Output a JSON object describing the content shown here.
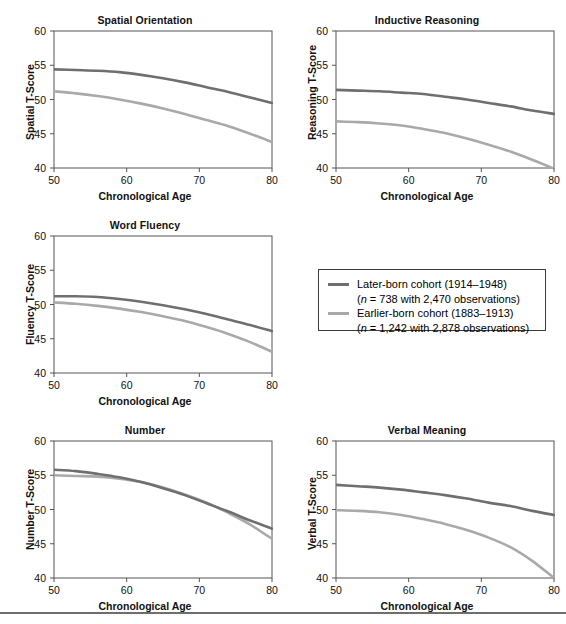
{
  "figure": {
    "x_axis_label": "Chronological Age",
    "x_ticks": [
      "50",
      "60",
      "70",
      "80"
    ],
    "y_ticks": [
      "40",
      "45",
      "50",
      "55",
      "60"
    ],
    "xlim": [
      50,
      80
    ],
    "ylim": [
      40,
      60
    ]
  },
  "legend": {
    "series": [
      {
        "key": "later",
        "color": "#6f6f6f",
        "line1": "Later-born cohort (1914–1948)",
        "line2_prefix": "n",
        "line2": " = 738 with 2,470 observations)",
        "line2_open": "("
      },
      {
        "key": "earlier",
        "color": "#a9a9a9",
        "line1": "Earlier-born cohort (1883–1913)",
        "line2_prefix": "n",
        "line2": " = 1,242 with 2,878 observations)",
        "line2_open": "("
      }
    ]
  },
  "chart_data": [
    {
      "id": "spatial-orientation",
      "type": "line",
      "title": "Spatial Orientation",
      "xlabel": "Chronological Age",
      "ylabel": "Spatial T-Score",
      "xlim": [
        50,
        80
      ],
      "ylim": [
        40,
        60
      ],
      "xticks": [
        50,
        60,
        70,
        80
      ],
      "yticks": [
        40,
        45,
        50,
        55,
        60
      ],
      "grid": false,
      "legend_position": "external-middle-right",
      "x": [
        50,
        53,
        56,
        59,
        62,
        65,
        68,
        71,
        74,
        77,
        80
      ],
      "series": [
        {
          "name": "Later-born cohort (1914–1948)",
          "color": "#6f6f6f",
          "values": [
            54.4,
            54.3,
            54.2,
            54.0,
            53.6,
            53.1,
            52.5,
            51.8,
            51.1,
            50.3,
            49.5
          ]
        },
        {
          "name": "Earlier-born cohort (1883–1913)",
          "color": "#a9a9a9",
          "values": [
            51.2,
            50.9,
            50.5,
            50.0,
            49.4,
            48.7,
            47.9,
            47.0,
            46.1,
            45.0,
            43.8
          ]
        }
      ]
    },
    {
      "id": "inductive-reasoning",
      "type": "line",
      "title": "Inductive Reasoning",
      "xlabel": "Chronological Age",
      "ylabel": "Reasoning T-Score",
      "xlim": [
        50,
        80
      ],
      "ylim": [
        40,
        60
      ],
      "xticks": [
        50,
        60,
        70,
        80
      ],
      "yticks": [
        40,
        45,
        50,
        55,
        60
      ],
      "grid": false,
      "x": [
        50,
        53,
        56,
        59,
        62,
        65,
        68,
        71,
        74,
        77,
        80
      ],
      "series": [
        {
          "name": "Later-born cohort (1914–1948)",
          "color": "#6f6f6f",
          "values": [
            51.4,
            51.3,
            51.2,
            51.0,
            50.8,
            50.4,
            50.0,
            49.5,
            49.0,
            48.4,
            47.9
          ]
        },
        {
          "name": "Earlier-born cohort (1883–1913)",
          "color": "#a9a9a9",
          "values": [
            46.8,
            46.7,
            46.5,
            46.2,
            45.7,
            45.1,
            44.3,
            43.4,
            42.4,
            41.2,
            39.9
          ]
        }
      ]
    },
    {
      "id": "word-fluency",
      "type": "line",
      "title": "Word Fluency",
      "xlabel": "Chronological Age",
      "ylabel": "Fluency T-Score",
      "xlim": [
        50,
        80
      ],
      "ylim": [
        40,
        60
      ],
      "xticks": [
        50,
        60,
        70,
        80
      ],
      "yticks": [
        40,
        45,
        50,
        55,
        60
      ],
      "grid": false,
      "x": [
        50,
        53,
        56,
        59,
        62,
        65,
        68,
        71,
        74,
        77,
        80
      ],
      "series": [
        {
          "name": "Later-born cohort (1914–1948)",
          "color": "#6f6f6f",
          "values": [
            51.2,
            51.2,
            51.1,
            50.8,
            50.4,
            49.9,
            49.3,
            48.6,
            47.8,
            47.0,
            46.1
          ]
        },
        {
          "name": "Earlier-born cohort (1883–1913)",
          "color": "#a9a9a9",
          "values": [
            50.3,
            50.1,
            49.8,
            49.4,
            48.9,
            48.3,
            47.6,
            46.7,
            45.7,
            44.5,
            43.1
          ]
        }
      ]
    },
    {
      "id": "number",
      "type": "line",
      "title": "Number",
      "xlabel": "Chronological Age",
      "ylabel": "Number T-Score",
      "xlim": [
        50,
        80
      ],
      "ylim": [
        40,
        60
      ],
      "xticks": [
        50,
        60,
        70,
        80
      ],
      "yticks": [
        40,
        45,
        50,
        55,
        60
      ],
      "grid": false,
      "x": [
        50,
        53,
        56,
        59,
        62,
        65,
        68,
        71,
        74,
        77,
        80
      ],
      "series": [
        {
          "name": "Later-born cohort (1914–1948)",
          "color": "#6f6f6f",
          "values": [
            55.8,
            55.6,
            55.2,
            54.7,
            54.0,
            53.1,
            52.1,
            50.9,
            49.7,
            48.4,
            47.2
          ]
        },
        {
          "name": "Earlier-born cohort (1883–1913)",
          "color": "#a9a9a9",
          "values": [
            55.0,
            54.9,
            54.8,
            54.5,
            54.0,
            53.2,
            52.2,
            51.0,
            49.5,
            47.8,
            45.7
          ]
        }
      ]
    },
    {
      "id": "verbal-meaning",
      "type": "line",
      "title": "Verbal Meaning",
      "xlabel": "Chronological Age",
      "ylabel": "Verbal T-Score",
      "xlim": [
        50,
        80
      ],
      "ylim": [
        40,
        60
      ],
      "xticks": [
        50,
        60,
        70,
        80
      ],
      "yticks": [
        40,
        45,
        50,
        55,
        60
      ],
      "grid": false,
      "x": [
        50,
        53,
        56,
        59,
        62,
        65,
        68,
        71,
        74,
        77,
        80
      ],
      "series": [
        {
          "name": "Later-born cohort (1914–1948)",
          "color": "#6f6f6f",
          "values": [
            53.6,
            53.4,
            53.2,
            52.9,
            52.5,
            52.1,
            51.6,
            51.0,
            50.5,
            49.8,
            49.2
          ]
        },
        {
          "name": "Earlier-born cohort (1883–1913)",
          "color": "#a9a9a9",
          "values": [
            49.9,
            49.8,
            49.6,
            49.2,
            48.6,
            47.9,
            47.0,
            45.9,
            44.5,
            42.5,
            40.0
          ]
        }
      ]
    }
  ]
}
